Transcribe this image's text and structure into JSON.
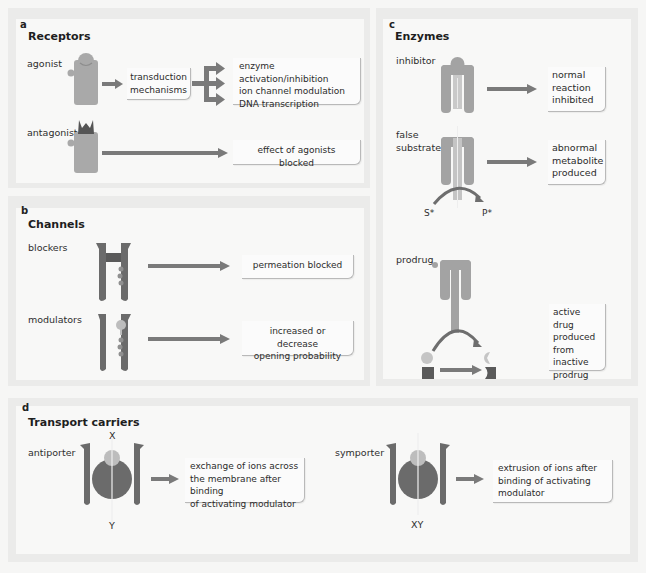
{
  "figure": {
    "colors": {
      "background": "#f6f6f5",
      "frame": "#ebebea",
      "panel": "#f8f8f7",
      "receptor": "#a9a9a9",
      "dark_shape": "#5a5a5a",
      "ligand": "#cfcfcf",
      "arrow": "#7a7a7a",
      "box_border": "#b9b9b9"
    }
  },
  "panel_a": {
    "letter": "a",
    "title": "Receptors",
    "rows": [
      {
        "label": "agonist",
        "mechanism_box": [
          "transduction",
          "mechanisms"
        ],
        "outcomes": [
          "enzyme activation/inhibition",
          "ion channel modulation",
          "DNA transcription"
        ]
      },
      {
        "label": "antagonist",
        "outcome": "effect of agonists blocked"
      }
    ]
  },
  "panel_b": {
    "letter": "b",
    "title": "Channels",
    "rows": [
      {
        "label": "blockers",
        "outcome": [
          "permeation blocked"
        ]
      },
      {
        "label": "modulators",
        "outcome": [
          "increased or decrease",
          "opening probability"
        ]
      }
    ]
  },
  "panel_c": {
    "letter": "c",
    "title": "Enzymes",
    "rows": [
      {
        "label": [
          "inhibitor"
        ],
        "outcome": [
          "normal",
          "reaction",
          "inhibited"
        ]
      },
      {
        "label": [
          "false",
          "substrate"
        ],
        "outcome": [
          "abnormal",
          "metabolite",
          "produced"
        ],
        "substrate": "S*",
        "product": "P*"
      },
      {
        "label": [
          "prodrug"
        ],
        "outcome": [
          "active drug",
          "produced",
          "from",
          "inactive",
          "prodrug"
        ]
      }
    ]
  },
  "panel_d": {
    "letter": "d",
    "title": "Transport carriers",
    "rows": [
      {
        "label": "antiporter",
        "top_ion": "X",
        "bottom_ion": "Y",
        "outcome": [
          "exchange of ions across",
          "the membrane after binding",
          "of activating modulator"
        ]
      },
      {
        "label": "symporter",
        "bottom_ion": "XY",
        "outcome": [
          "extrusion of ions after",
          "binding of activating",
          "modulator"
        ]
      }
    ]
  }
}
